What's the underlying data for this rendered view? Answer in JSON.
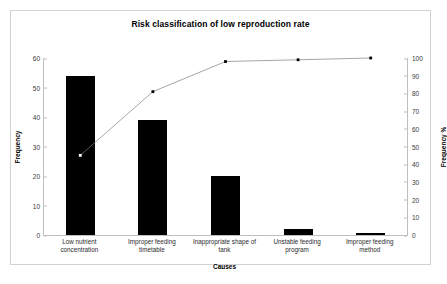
{
  "chart_data": {
    "type": "bar",
    "title": "Risk classification of low reproduction rate",
    "xlabel": "Causes",
    "ylabel": "Frequency",
    "y2label": "Frequency %",
    "categories": [
      "Low nutrient concentration",
      "Improper feeding timetable",
      "Inappropriate shape of tank",
      "Unstable feeding program",
      "Improper feeding method"
    ],
    "series": [
      {
        "name": "Frequency",
        "type": "bar",
        "values": [
          54,
          39,
          20,
          2,
          0.5
        ]
      },
      {
        "name": "Cumulative Frequency %",
        "type": "line",
        "values": [
          45,
          81,
          98,
          99,
          100
        ]
      }
    ],
    "ylim": [
      0,
      60
    ],
    "y2lim": [
      0,
      100
    ],
    "yticks": [
      0,
      10,
      20,
      30,
      40,
      50,
      60
    ],
    "y2ticks": [
      0,
      10,
      20,
      30,
      40,
      50,
      60,
      70,
      80,
      90,
      100
    ],
    "grid": false,
    "legend": "none",
    "bar_color": "#000000",
    "line_color": "#808080",
    "marker_color": "#000000",
    "frame_color": "#d2d2d2",
    "background": "#ffffff"
  },
  "categories_wrapped": [
    [
      "Low nutrient",
      "concentration"
    ],
    [
      "Improper feeding",
      "timetable"
    ],
    [
      "Inappropriate shape of",
      "tank"
    ],
    [
      "Unstable feeding",
      "program"
    ],
    [
      "Improper feeding",
      "method"
    ]
  ]
}
